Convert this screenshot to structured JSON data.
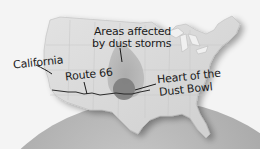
{
  "map": {
    "subject": "Dust Bowl region of the United States",
    "colors": {
      "background": "#f4f4f4",
      "globe": "#a9a9a9",
      "land": "#d9d9d9",
      "dust_area": "#b3b3b3",
      "heart": "#7d7d7d",
      "route": "#2a2a2a",
      "text": "#1a1a1a"
    },
    "labels": {
      "areas_affected_line1": "Areas affected",
      "areas_affected_line2": "by dust storms",
      "california": "California",
      "route66": "Route 66",
      "heart_line1": "Heart of the",
      "heart_line2": "Dust Bowl"
    }
  }
}
